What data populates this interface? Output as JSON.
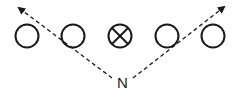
{
  "diagram": {
    "type": "play-diagram",
    "players": [
      {
        "id": "p1",
        "symbol": "circle",
        "cx": 27,
        "cy": 36
      },
      {
        "id": "p2",
        "symbol": "circle",
        "cx": 73,
        "cy": 36
      },
      {
        "id": "center",
        "symbol": "circle-x",
        "cx": 120,
        "cy": 36
      },
      {
        "id": "p4",
        "symbol": "circle",
        "cx": 167,
        "cy": 36
      },
      {
        "id": "p5",
        "symbol": "circle",
        "cx": 213,
        "cy": 36
      }
    ],
    "origin_label": "N",
    "routes": [
      {
        "name": "left-route",
        "from": [
          112,
          78
        ],
        "to": [
          18,
          7
        ],
        "style": "dashed",
        "head": "arrow"
      },
      {
        "name": "right-route",
        "from": [
          133,
          78
        ],
        "to": [
          225,
          6
        ],
        "style": "dashed",
        "head": "arrow"
      }
    ],
    "colors": {
      "stroke": "#1a1a1a",
      "background": "#ffffff"
    }
  }
}
